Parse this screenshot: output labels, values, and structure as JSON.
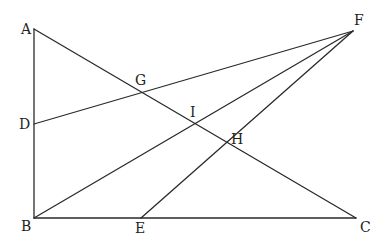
{
  "diagram": {
    "type": "geometry",
    "points": [
      {
        "name": "A",
        "x": 34,
        "y": 29,
        "label_dx": -13,
        "label_dy": 5
      },
      {
        "name": "B",
        "x": 34,
        "y": 218,
        "label_dx": -13,
        "label_dy": 13
      },
      {
        "name": "C",
        "x": 356,
        "y": 218,
        "label_dx": 4,
        "label_dy": 14
      },
      {
        "name": "D",
        "x": 34,
        "y": 124,
        "label_dx": -15,
        "label_dy": 5
      },
      {
        "name": "E",
        "x": 141,
        "y": 218,
        "label_dx": -6,
        "label_dy": 15
      },
      {
        "name": "F",
        "x": 353,
        "y": 31,
        "label_dx": 1,
        "label_dy": -6
      },
      {
        "name": "G",
        "x": 139,
        "y": 91,
        "label_dx": -4,
        "label_dy": -6
      },
      {
        "name": "I",
        "x": 193,
        "y": 124,
        "label_dx": -3,
        "label_dy": -7
      },
      {
        "name": "H",
        "x": 225,
        "y": 143,
        "label_dx": 6,
        "label_dy": 1
      }
    ],
    "segments": [
      {
        "from": "A",
        "to": "B"
      },
      {
        "from": "B",
        "to": "C"
      },
      {
        "from": "A",
        "to": "C"
      },
      {
        "from": "D",
        "to": "F"
      },
      {
        "from": "B",
        "to": "F"
      },
      {
        "from": "E",
        "to": "F"
      }
    ],
    "colors": {
      "line": "#2a2a2a",
      "label": "#222222",
      "background": "#ffffff"
    }
  }
}
